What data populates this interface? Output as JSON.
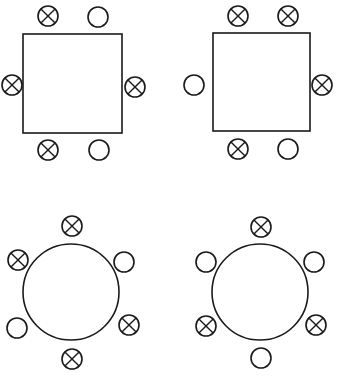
{
  "figure": {
    "canvas": {
      "width": 339,
      "height": 377
    },
    "colors": {
      "stroke": "#1a1a1a",
      "fill": "#ffffff",
      "background": "#ffffff"
    },
    "legend": {
      "occupied_symbol": "crossed-circle",
      "empty_symbol": "plain-circle"
    },
    "stroke_widths": {
      "table": 1.6,
      "seat_ring": 1.6,
      "seat_cross": 1.4
    },
    "seat_radius": 10
  },
  "diagrams": [
    {
      "id": "top-left",
      "name": "square-table-1",
      "table_type": "square",
      "table": {
        "x": 23,
        "y": 34,
        "width": 99,
        "height": 99
      },
      "seat_count": 6,
      "occupied_count": 4,
      "empty_count": 2,
      "seats": [
        {
          "id": "tl1-top-left",
          "position": "top-left",
          "cx": 48,
          "cy": 16,
          "state": "occupied"
        },
        {
          "id": "tl1-top-right",
          "position": "top-right",
          "cx": 98,
          "cy": 17,
          "state": "empty"
        },
        {
          "id": "tl1-left",
          "position": "left",
          "cx": 12,
          "cy": 85,
          "state": "occupied"
        },
        {
          "id": "tl1-right",
          "position": "right",
          "cx": 135,
          "cy": 87,
          "state": "occupied"
        },
        {
          "id": "tl1-bottom-left",
          "position": "bottom-left",
          "cx": 48,
          "cy": 150,
          "state": "occupied"
        },
        {
          "id": "tl1-bottom-right",
          "position": "bottom-right",
          "cx": 99,
          "cy": 150,
          "state": "empty"
        }
      ]
    },
    {
      "id": "top-right",
      "name": "square-table-2",
      "table_type": "square",
      "table": {
        "x": 213,
        "y": 33,
        "width": 97,
        "height": 98
      },
      "seat_count": 6,
      "occupied_count": 4,
      "empty_count": 2,
      "seats": [
        {
          "id": "tr1-top-left",
          "position": "top-left",
          "cx": 238,
          "cy": 16,
          "state": "occupied"
        },
        {
          "id": "tr1-top-right",
          "position": "top-right",
          "cx": 288,
          "cy": 16,
          "state": "occupied"
        },
        {
          "id": "tr1-left",
          "position": "left",
          "cx": 194,
          "cy": 85,
          "state": "empty"
        },
        {
          "id": "tr1-right",
          "position": "right",
          "cx": 322,
          "cy": 85,
          "state": "occupied"
        },
        {
          "id": "tr1-bottom-left",
          "position": "bottom-left",
          "cx": 238,
          "cy": 149,
          "state": "occupied"
        },
        {
          "id": "tr1-bottom-right",
          "position": "bottom-right",
          "cx": 288,
          "cy": 149,
          "state": "empty"
        }
      ]
    },
    {
      "id": "bottom-left",
      "name": "round-table-1",
      "table_type": "round",
      "table": {
        "cx": 71,
        "cy": 292,
        "r": 48
      },
      "seat_count": 6,
      "occupied_count": 4,
      "empty_count": 2,
      "seats": [
        {
          "id": "bl1-top",
          "position": "top",
          "cx": 72,
          "cy": 226,
          "state": "occupied"
        },
        {
          "id": "bl1-upper-right",
          "position": "upper-right",
          "cx": 124,
          "cy": 262,
          "state": "empty"
        },
        {
          "id": "bl1-lower-right",
          "position": "lower-right",
          "cx": 129,
          "cy": 325,
          "state": "occupied"
        },
        {
          "id": "bl1-bottom",
          "position": "bottom",
          "cx": 72,
          "cy": 359,
          "state": "occupied"
        },
        {
          "id": "bl1-lower-left",
          "position": "lower-left",
          "cx": 17,
          "cy": 328,
          "state": "empty"
        },
        {
          "id": "bl1-upper-left",
          "position": "upper-left",
          "cx": 18,
          "cy": 260,
          "state": "occupied"
        }
      ]
    },
    {
      "id": "bottom-right",
      "name": "round-table-2",
      "table_type": "round",
      "table": {
        "cx": 260,
        "cy": 292,
        "r": 48
      },
      "seat_count": 6,
      "occupied_count": 3,
      "empty_count": 3,
      "seats": [
        {
          "id": "br1-top",
          "position": "top",
          "cx": 261,
          "cy": 227,
          "state": "occupied"
        },
        {
          "id": "br1-upper-right",
          "position": "upper-right",
          "cx": 314,
          "cy": 262,
          "state": "empty"
        },
        {
          "id": "br1-lower-right",
          "position": "lower-right",
          "cx": 316,
          "cy": 325,
          "state": "occupied"
        },
        {
          "id": "br1-bottom",
          "position": "bottom",
          "cx": 261,
          "cy": 358,
          "state": "empty"
        },
        {
          "id": "br1-lower-left",
          "position": "lower-left",
          "cx": 206,
          "cy": 326,
          "state": "occupied"
        },
        {
          "id": "br1-upper-left",
          "position": "upper-left",
          "cx": 206,
          "cy": 262,
          "state": "empty"
        }
      ]
    }
  ]
}
